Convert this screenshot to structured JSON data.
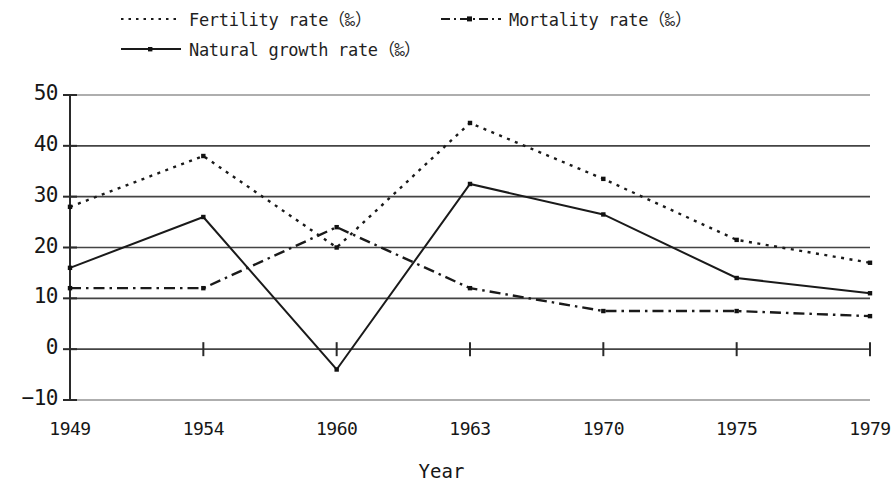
{
  "legend": {
    "position": "top-left",
    "items": [
      {
        "key": "fertility",
        "label": "Fertility rate（‰）",
        "style": "dotted"
      },
      {
        "key": "mortality",
        "label": "Mortality rate（‰）",
        "style": "dash-dot"
      },
      {
        "key": "growth",
        "label": "Natural growth rate（‰）",
        "style": "solid"
      }
    ]
  },
  "axes": {
    "x_title": "Year",
    "y_title": "",
    "y_ticks": [
      "50",
      "40",
      "30",
      "20",
      "10",
      "0",
      "−10"
    ],
    "x_ticks": [
      "1949",
      "1954",
      "1960",
      "1963",
      "1970",
      "1975",
      "1979"
    ]
  },
  "chart_data": {
    "type": "line",
    "title": "",
    "xlabel": "Year",
    "ylabel": "",
    "categories": [
      "1949",
      "1954",
      "1960",
      "1963",
      "1970",
      "1975",
      "1979"
    ],
    "x": [
      1949,
      1954,
      1960,
      1963,
      1970,
      1975,
      1979
    ],
    "ylim": [
      -10,
      50
    ],
    "ytick_values": [
      50,
      40,
      30,
      20,
      10,
      0,
      -10
    ],
    "grid": true,
    "legend_position": "top-left",
    "units": "per mille (‰)",
    "series": [
      {
        "name": "Fertility rate（‰）",
        "key": "fertility",
        "line_style": "dotted",
        "color": "#1a1a1a",
        "values": [
          28,
          38,
          20,
          44.5,
          33.5,
          21.5,
          17
        ]
      },
      {
        "name": "Mortality rate（‰）",
        "key": "mortality",
        "line_style": "dash-dot",
        "color": "#1a1a1a",
        "values": [
          12,
          12,
          24,
          12,
          7.5,
          7.5,
          6.5
        ]
      },
      {
        "name": "Natural growth rate（‰）",
        "key": "growth",
        "line_style": "solid",
        "color": "#1a1a1a",
        "values": [
          16,
          26,
          -4,
          32.5,
          26.5,
          14,
          11
        ]
      }
    ]
  }
}
